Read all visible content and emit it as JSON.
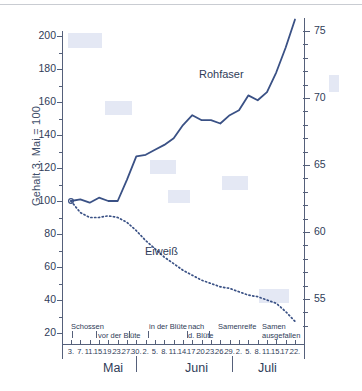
{
  "chart_data": {
    "type": "line",
    "title": "",
    "ylabel": "Gehalt 3. Mai = 100",
    "ylabel_right": "Verdauungsquotient der organischen Substanz",
    "xlabel": "",
    "ylim": [
      10,
      210
    ],
    "ylim_right": [
      52,
      77
    ],
    "yticks": [
      200,
      180,
      160,
      140,
      120,
      100,
      80,
      60,
      40,
      20
    ],
    "yticks_right": [
      75,
      70,
      65,
      60,
      55
    ],
    "grid": false,
    "legend": "inline-annotations",
    "x": [
      "3.",
      "7.",
      "11.",
      "15.",
      "19.",
      "23.",
      "27.",
      "30.",
      "2.",
      "5.",
      "8.",
      "11.",
      "14.",
      "17.",
      "20.",
      "23.",
      "26.",
      "29.",
      "2.",
      "5.",
      "8.",
      "11.",
      "15.",
      "17.",
      "22."
    ],
    "months": [
      "Mai",
      "Juni",
      "Juli"
    ],
    "phases": [
      "Schossen",
      "vor der Blüte",
      "in der Blüte",
      "nach d. Blüte",
      "Samenreife",
      "Samen ausgefallen"
    ],
    "series": [
      {
        "name": "Rohfaser",
        "style": "solid",
        "color": "#3a5185",
        "axis": "left",
        "values": [
          100,
          101,
          99,
          102,
          100,
          100,
          113,
          127,
          128,
          131,
          134,
          138,
          146,
          152,
          149,
          149,
          147,
          152,
          155,
          164,
          161,
          166,
          178,
          193,
          210
        ]
      },
      {
        "name": "Eiweiß",
        "style": "dotted",
        "color": "#3a5185",
        "axis": "left",
        "values": [
          100,
          93,
          90,
          90,
          91,
          90,
          87,
          82,
          76,
          71,
          66,
          62,
          58,
          55,
          52,
          50,
          48,
          47,
          45,
          43,
          42,
          40,
          38,
          33,
          27
        ]
      }
    ]
  },
  "annotations": {
    "rohfaser_label": "Rohfaser",
    "eiweiss_label": "Eiweiß"
  },
  "axes": {
    "left_title": "Gehalt 3. Mai = 100",
    "right_title": "Verdauungsquotient der organischen Substanz"
  },
  "xaxis": {
    "ticks": [
      "3.",
      "7.",
      "11.",
      "15.",
      "19.",
      "23.",
      "27.",
      "30.",
      "2.",
      "5.",
      "8.",
      "11.",
      "14.",
      "17.",
      "20.",
      "23.",
      "26.",
      "29.",
      "2.",
      "5.",
      "8.",
      "11.",
      "15.",
      "17.",
      "22."
    ],
    "months": [
      {
        "label": "Mai"
      },
      {
        "label": "Juni"
      },
      {
        "label": "Juli"
      }
    ],
    "phases": [
      {
        "line1": "Schossen",
        "line2": ""
      },
      {
        "line1": "vor der Blüte",
        "line2": ""
      },
      {
        "line1": "in der Blüte",
        "line2": ""
      },
      {
        "line1": "nach",
        "line2": "d. Blüte"
      },
      {
        "line1": "Samenreife",
        "line2": ""
      },
      {
        "line1": "Samen",
        "line2": "ausgefallen"
      }
    ]
  },
  "yaxis_left": {
    "ticks": [
      "200",
      "180",
      "160",
      "140",
      "120",
      "100",
      "80",
      "60",
      "40",
      "20"
    ]
  },
  "yaxis_right": {
    "ticks": [
      "75",
      "70",
      "65",
      "60",
      "55"
    ]
  }
}
